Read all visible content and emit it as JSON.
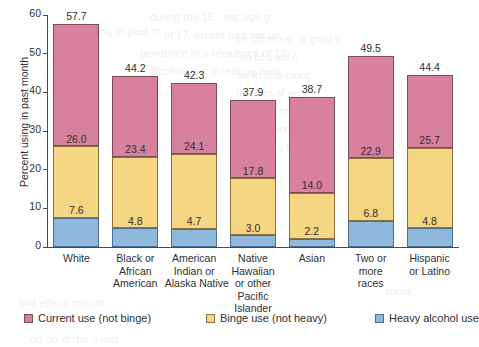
{
  "chart_data": {
    "type": "bar",
    "subtype": "stacked-vertical",
    "title": "",
    "xlabel": "",
    "ylabel": "Percent using in past month",
    "ylim": [
      0,
      60
    ],
    "yticks": [
      0,
      10,
      20,
      30,
      40,
      50,
      60
    ],
    "ytick_labels": [
      "0",
      "10",
      "20",
      "30",
      "40",
      "50",
      "60"
    ],
    "grid": false,
    "legend_position": "bottom",
    "categories": [
      "White",
      "Black or African American",
      "American Indian or Alaska Native",
      "Native Hawaiian or other Pacific Islander",
      "Asian",
      "Two or more races",
      "Hispanic or Latino"
    ],
    "category_label_lines": [
      [
        "White"
      ],
      [
        "Black or",
        "African",
        "American"
      ],
      [
        "American",
        "Indian or",
        "Alaska Native"
      ],
      [
        "Native",
        "Hawaiian",
        "or other",
        "Pacific",
        "Islander"
      ],
      [
        "Asian"
      ],
      [
        "Two or",
        "more",
        "races"
      ],
      [
        "Hispanic",
        "or Latino"
      ]
    ],
    "series": [
      {
        "name": "Heavy alcohol use",
        "color": "#8fb8dd",
        "values": [
          7.6,
          4.8,
          4.7,
          3.0,
          2.2,
          6.8,
          4.8
        ]
      },
      {
        "name": "Binge use (not heavy)",
        "color": "#f6d583",
        "values": [
          18.4,
          18.6,
          19.4,
          14.8,
          11.8,
          16.1,
          20.9
        ]
      },
      {
        "name": "Current use (not binge)",
        "color": "#d8819f",
        "values": [
          31.7,
          20.8,
          18.2,
          20.1,
          24.7,
          26.6,
          18.7
        ]
      }
    ],
    "totals": [
      57.7,
      44.2,
      42.3,
      37.9,
      38.7,
      49.5,
      44.4
    ],
    "total_labels": [
      "57.7",
      "44.2",
      "42.3",
      "37.9",
      "38.7",
      "49.5",
      "44.4"
    ],
    "cumulative_heavy_labels": [
      "7.6",
      "4.8",
      "4.7",
      "3.0",
      "2.2",
      "6.8",
      "4.8"
    ],
    "cumulative_binge_labels": [
      "26.0",
      "23.4",
      "24.1",
      "17.8",
      "14.0",
      "22.9",
      "25.7"
    ]
  },
  "legend": [
    {
      "label": "Current use (not binge)",
      "swatch": "pink"
    },
    {
      "label": "Binge use (not heavy)",
      "swatch": "yellow"
    },
    {
      "label": "Heavy alcohol use",
      "swatch": "blue"
    }
  ],
  "ghost_text": [
    "during the 15 - ear age g",
    "of 17.  ercent and  ere pe",
    "pendence in a  revalence of 10.",
    "alcohol use.  5 reaking  own",
    "Percent using in past m",
    "for other rac al  grou s",
    "se of s eci c",
    "se in one mont",
    "re uenc  of an",
    "n a comm n",
    "cohol and",
    "among t",
    "racial",
    "and ethnic minorit",
    "ort on of the  o ulat"
  ]
}
